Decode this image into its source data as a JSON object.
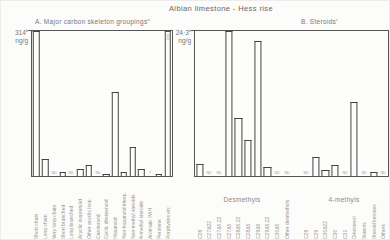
{
  "figure": {
    "title": "Albian limestone - Hess rise"
  },
  "chart_data": [
    {
      "panel": "A",
      "type": "bar",
      "title": "A. Major carbon skeleton groupings",
      "title_sup": "a",
      "axis_value": "314",
      "axis_sup": "b",
      "axis_unit": "ng/g",
      "ylabel": "ng/g",
      "ylim": [
        0,
        314
      ],
      "grid": false,
      "note": "bars unfilled outlines; ND = not detected; T = trace; last bar off-scale with dashed top",
      "items": [
        {
          "label": "Short chain",
          "ngg": 314,
          "pct": 100
        },
        {
          "label": "Long chain",
          "ngg": 38,
          "pct": 12
        },
        {
          "label": "Very long chain",
          "mark": "ND"
        },
        {
          "label": "Short branched",
          "ngg": 8,
          "pct": 2.5
        },
        {
          "label": "Long branched",
          "mark": "ND"
        },
        {
          "label": "Acyclic isoprenoid",
          "ngg": 16,
          "pct": 5
        },
        {
          "label": "Other acyclic isop.",
          "ngg": 24,
          "pct": 7.5
        },
        {
          "label": "Carotenoid",
          "mark": "ND"
        },
        {
          "label": "Cyclic diterpenoid",
          "ngg": 5,
          "pct": 1.5
        },
        {
          "label": "Hopanoid",
          "ngg": 182,
          "pct": 58
        },
        {
          "label": "Non-hopanoid triterp.",
          "ngg": 8,
          "pct": 2.5
        },
        {
          "label": "Non-methyl steroids",
          "ngg": 63,
          "pct": 20
        },
        {
          "label": "4-methyl steroids",
          "ngg": 16,
          "pct": 5
        },
        {
          "label": "Aromatic PAH",
          "mark": "T"
        },
        {
          "label": "Perylene",
          "ngg": 5,
          "pct": 1.5
        },
        {
          "label": "Porphyrins etc.",
          "ngg": ">314",
          "pct": 100,
          "dashed_top": true,
          "inner_label": "(x2)"
        }
      ]
    },
    {
      "panel": "B",
      "type": "bar",
      "title": "B. Steroids",
      "title_sup": "c",
      "axis_value": "24·3",
      "axis_sup": "b",
      "axis_unit": "ng/g",
      "ylabel": "ng/g",
      "ylim": [
        0,
        24.3
      ],
      "grid": false,
      "groups": [
        {
          "name": "Desmethyls"
        },
        {
          "name": "4-methyls"
        }
      ],
      "items": [
        {
          "group": "Desmethyls",
          "label": "C26",
          "ngg": 1.9,
          "pct": 8
        },
        {
          "group": "Desmethyls",
          "label": "C27Δ22",
          "mark": "ND"
        },
        {
          "group": "Desmethyls",
          "label": "C27Δ5,22",
          "mark": "ND"
        },
        {
          "group": "Desmethyls",
          "label": "C27Δ5",
          "ngg": 24.3,
          "pct": 100
        },
        {
          "group": "Desmethyls",
          "label": "C28Δ5,22",
          "ngg": 9.7,
          "pct": 40
        },
        {
          "group": "Desmethyls",
          "label": "C28Δ5",
          "ngg": 6.1,
          "pct": 25
        },
        {
          "group": "Desmethyls",
          "label": "C29Δ5",
          "ngg": 22.6,
          "pct": 93
        },
        {
          "group": "Desmethyls",
          "label": "C29Δ5,22",
          "ngg": 1.5,
          "pct": 6
        },
        {
          "group": "Desmethyls",
          "label": "C30Δ5",
          "mark": "ND"
        },
        {
          "group": "Desmethyls",
          "label": "Other desmethyls",
          "mark": "ND"
        },
        {
          "spacer": true
        },
        {
          "group": "4-methyls",
          "label": "C28",
          "mark": "ND"
        },
        {
          "group": "4-methyls",
          "label": "C29",
          "ngg": 3.2,
          "pct": 13
        },
        {
          "group": "4-methyls",
          "label": "C30Δ22",
          "ngg": 1.0,
          "pct": 4
        },
        {
          "group": "4-methyls",
          "label": "C30",
          "ngg": 1.8,
          "pct": 7.5
        },
        {
          "group": "4-methyls",
          "label": "C31",
          "mark": "ND"
        },
        {
          "group": "4-methyls",
          "label": "Dinosterol",
          "ngg": 12.4,
          "pct": 51
        },
        {
          "group": "4-methyls",
          "label": "Stanols",
          "mark": "ND"
        },
        {
          "group": "4-methyls",
          "label": "Steroid ketones",
          "ngg": 0.7,
          "pct": 3
        },
        {
          "group": "4-methyls",
          "label": "Others",
          "mark": "ND"
        }
      ]
    }
  ]
}
